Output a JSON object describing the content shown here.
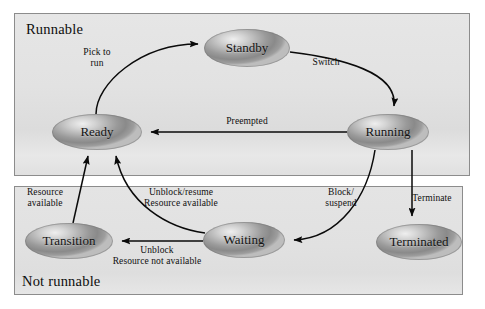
{
  "diagram": {
    "groups": [
      {
        "id": "runnable",
        "label": "Runnable",
        "label_position": "top-left"
      },
      {
        "id": "not-runnable",
        "label": "Not runnable",
        "label_position": "bottom-left"
      }
    ],
    "nodes": [
      {
        "id": "standby",
        "label": "Standby",
        "cx": 247,
        "cy": 48,
        "rx": 43,
        "ry": 19,
        "group": "runnable"
      },
      {
        "id": "ready",
        "label": "Ready",
        "cx": 97,
        "cy": 132,
        "rx": 45,
        "ry": 18,
        "group": "runnable"
      },
      {
        "id": "running",
        "label": "Running",
        "cx": 388,
        "cy": 132,
        "rx": 41,
        "ry": 18,
        "group": "runnable"
      },
      {
        "id": "transition",
        "label": "Transition",
        "cx": 69,
        "cy": 241,
        "rx": 44,
        "ry": 18,
        "group": "not-runnable"
      },
      {
        "id": "waiting",
        "label": "Waiting",
        "cx": 244,
        "cy": 240,
        "rx": 41,
        "ry": 18,
        "group": "not-runnable"
      },
      {
        "id": "terminated",
        "label": "Terminated",
        "cx": 419,
        "cy": 242,
        "rx": 43,
        "ry": 18,
        "group": "not-runnable"
      }
    ],
    "edges": [
      {
        "id": "ready-to-standby",
        "from": "ready",
        "to": "standby",
        "label": "Pick to\nrun",
        "label_x": 96,
        "label_y": 52
      },
      {
        "id": "standby-to-running",
        "from": "standby",
        "to": "running",
        "label": "Switch",
        "label_x": 325,
        "label_y": 62
      },
      {
        "id": "running-to-ready",
        "from": "running",
        "to": "ready",
        "label": "Preempted",
        "label_x": 246,
        "label_y": 121
      },
      {
        "id": "running-to-waiting",
        "from": "running",
        "to": "waiting",
        "label": "Block/\nsuspend",
        "label_x": 340,
        "label_y": 193
      },
      {
        "id": "running-to-terminated",
        "from": "running",
        "to": "terminated",
        "label": "Terminate",
        "label_x": 431,
        "label_y": 198
      },
      {
        "id": "transition-to-ready",
        "from": "transition",
        "to": "ready",
        "label": "Resource\navailable",
        "label_x": 44,
        "label_y": 192
      },
      {
        "id": "waiting-to-ready",
        "from": "waiting",
        "to": "ready",
        "label": "Unblock/resume\nResource available",
        "label_x": 180,
        "label_y": 192
      },
      {
        "id": "waiting-to-transition",
        "from": "waiting",
        "to": "transition",
        "label": "Unblock\nResource not available",
        "label_x": 156,
        "label_y": 250
      }
    ]
  },
  "colors": {
    "panel_fill": "#e3e3e3",
    "panel_border": "#8c8c8c",
    "node_dark": "#8a8a8a",
    "node_light": "#efefef",
    "edge_stroke": "#0a0a0a",
    "text": "#111111",
    "page_background": "#ffffff"
  }
}
